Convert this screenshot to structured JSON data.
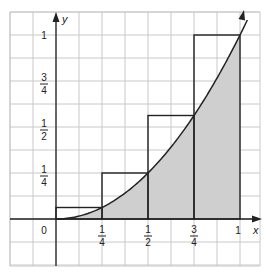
{
  "figure": {
    "axis_labels": {
      "x": "x",
      "y": "y"
    },
    "origin_label": "0",
    "x_ticks": [
      {
        "value": 0.25,
        "num": "1",
        "den": "4"
      },
      {
        "value": 0.5,
        "num": "1",
        "den": "2"
      },
      {
        "value": 0.75,
        "num": "3",
        "den": "4"
      },
      {
        "value": 1,
        "text": "1"
      }
    ],
    "y_ticks": [
      {
        "value": 0.25,
        "num": "1",
        "den": "4"
      },
      {
        "value": 0.5,
        "num": "1",
        "den": "2"
      },
      {
        "value": 0.75,
        "num": "3",
        "den": "4"
      },
      {
        "value": 1,
        "text": "1"
      }
    ],
    "colors": {
      "grid": "#c8c8c8",
      "axis": "#222222",
      "shade": "#cfcfcf",
      "rect": "#222222"
    }
  },
  "chart_data": {
    "type": "area",
    "title": "",
    "xlabel": "x",
    "ylabel": "y",
    "function": "y = x^2",
    "x": [
      0,
      0.25,
      0.5,
      0.75,
      1
    ],
    "curve_y": [
      0,
      0.0625,
      0.25,
      0.5625,
      1
    ],
    "upper_rectangles": [
      {
        "x_start": 0,
        "x_end": 0.25,
        "height": 0.0625
      },
      {
        "x_start": 0.25,
        "x_end": 0.5,
        "height": 0.25
      },
      {
        "x_start": 0.5,
        "x_end": 0.75,
        "height": 0.5625
      },
      {
        "x_start": 0.75,
        "x_end": 1,
        "height": 1
      }
    ],
    "shaded_region": "area under curve from x=0 to x=1",
    "xlim": [
      -0.25,
      1.1
    ],
    "ylim": [
      -0.25,
      1.125
    ],
    "grid": true,
    "grid_step": 0.125
  }
}
